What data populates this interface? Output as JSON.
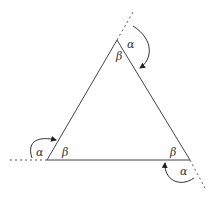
{
  "diagram": {
    "type": "triangle-exterior-angles",
    "labels": {
      "top_exterior": "α",
      "top_interior": "β",
      "left_exterior": "α",
      "left_interior": "β",
      "right_interior": "β",
      "right_exterior": "α"
    },
    "colors": {
      "stroke": "#333333",
      "background": "#ffffff"
    }
  }
}
